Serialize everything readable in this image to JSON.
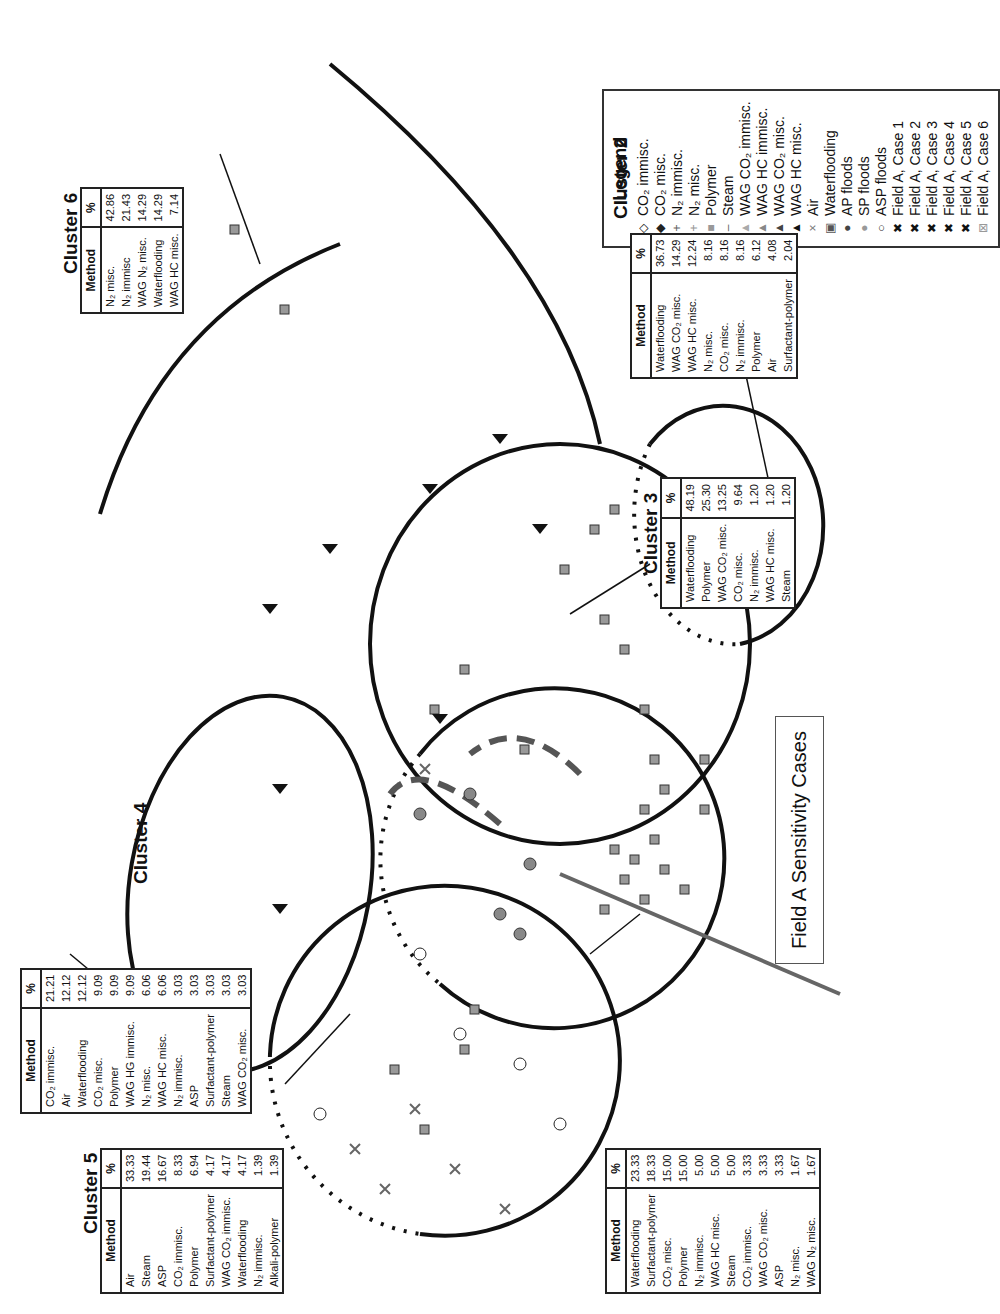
{
  "figure": {
    "orientation": "rotated 90deg counter-clockwise on page",
    "callout_label": "Field A Sensitivity Cases"
  },
  "legend": {
    "title": "Legend",
    "items": [
      {
        "symbol": "◇",
        "label": "CO₂ immisc.",
        "color": "#222"
      },
      {
        "symbol": "◆",
        "label": "CO₂ misc.",
        "color": "#222"
      },
      {
        "symbol": "+",
        "label": "N₂ immisc.",
        "color": "#666"
      },
      {
        "symbol": "+",
        "label": "N₂ misc.",
        "color": "#999"
      },
      {
        "symbol": "■",
        "label": "Polymer",
        "color": "#999"
      },
      {
        "symbol": "–",
        "label": "Steam",
        "color": "#666"
      },
      {
        "symbol": "▲",
        "label": "WAG CO₂ immisc.",
        "color": "#aaa"
      },
      {
        "symbol": "▲",
        "label": "WAG HC immisc.",
        "color": "#888"
      },
      {
        "symbol": "▲",
        "label": "WAG CO₂ misc.",
        "color": "#444"
      },
      {
        "symbol": "▲",
        "label": "WAG HC misc.",
        "color": "#111"
      },
      {
        "symbol": "×",
        "label": "Air",
        "color": "#777"
      },
      {
        "symbol": "▣",
        "label": "Waterflooding",
        "color": "#555"
      },
      {
        "symbol": "●",
        "label": "AP floods",
        "color": "#444"
      },
      {
        "symbol": "●",
        "label": "SP floods",
        "color": "#999"
      },
      {
        "symbol": "○",
        "label": "ASP floods",
        "color": "#222"
      },
      {
        "symbol": "✖",
        "label": "Field A, Case 1",
        "color": "#111"
      },
      {
        "symbol": "✖",
        "label": "Field A, Case 2",
        "color": "#111"
      },
      {
        "symbol": "✖",
        "label": "Field A, Case 3",
        "color": "#111"
      },
      {
        "symbol": "✖",
        "label": "Field A, Case 4",
        "color": "#111"
      },
      {
        "symbol": "✖",
        "label": "Field A, Case 5",
        "color": "#111"
      },
      {
        "symbol": "⊠",
        "label": "Field A, Case 6",
        "color": "#999"
      }
    ]
  },
  "clusters": [
    {
      "title": "Cluster 1",
      "headers": [
        "Method",
        "%"
      ],
      "rows": [
        [
          "Waterflooding",
          "23.33"
        ],
        [
          "Surfactant-polymer",
          "18.33"
        ],
        [
          "CO₂ misc.",
          "15.00"
        ],
        [
          "Polymer",
          "15.00"
        ],
        [
          "N₂ immisc.",
          "5.00"
        ],
        [
          "WAG HC misc.",
          "5.00"
        ],
        [
          "Steam",
          "5.00"
        ],
        [
          "CO₂ immisc.",
          "3.33"
        ],
        [
          "WAG CO₂ misc.",
          "3.33"
        ],
        [
          "ASP",
          "3.33"
        ],
        [
          "N₂ misc.",
          "1.67"
        ],
        [
          "WAG N₂ misc.",
          "1.67"
        ]
      ]
    },
    {
      "title": "Cluster 2",
      "headers": [
        "Method",
        "%"
      ],
      "rows": [
        [
          "Waterflooding",
          "36.73"
        ],
        [
          "WAG CO₂ misc.",
          "14.29"
        ],
        [
          "WAG HC misc.",
          "12.24"
        ],
        [
          "N₂ misc.",
          "8.16"
        ],
        [
          "CO₂ misc.",
          "8.16"
        ],
        [
          "N₂ immisc.",
          "8.16"
        ],
        [
          "Polymer",
          "6.12"
        ],
        [
          "Air",
          "4.08"
        ],
        [
          "Surfactant-polymer",
          "2.04"
        ]
      ]
    },
    {
      "title": "Cluster 3",
      "headers": [
        "Method",
        "%"
      ],
      "rows": [
        [
          "Waterflooding",
          "48.19"
        ],
        [
          "Polymer",
          "25.30"
        ],
        [
          "WAG CO₂ misc.",
          "13.25"
        ],
        [
          "CO₂ misc.",
          "9.64"
        ],
        [
          "N₂ immisc.",
          "1.20"
        ],
        [
          "WAG HC misc.",
          "1.20"
        ],
        [
          "Steam",
          "1.20"
        ]
      ]
    },
    {
      "title": "Cluster 4",
      "headers": [
        "Method",
        "%"
      ],
      "rows": [
        [
          "CO₂ immisc.",
          "21.21"
        ],
        [
          "Air",
          "12.12"
        ],
        [
          "Waterflooding",
          "12.12"
        ],
        [
          "CO₂ misc.",
          "9.09"
        ],
        [
          "Polymer",
          "9.09"
        ],
        [
          "WAG HG immisc.",
          "9.09"
        ],
        [
          "N₂ misc.",
          "6.06"
        ],
        [
          "WAG HC misc.",
          "6.06"
        ],
        [
          "N₂ immisc.",
          "3.03"
        ],
        [
          "ASP",
          "3.03"
        ],
        [
          "Surfactant-polymer",
          "3.03"
        ],
        [
          "Steam",
          "3.03"
        ],
        [
          "WAG CO₂ misc.",
          "3.03"
        ]
      ]
    },
    {
      "title": "Cluster 5",
      "headers": [
        "Method",
        "%"
      ],
      "rows": [
        [
          "Air",
          "33.33"
        ],
        [
          "Steam",
          "19.44"
        ],
        [
          "ASP",
          "16.67"
        ],
        [
          "CO₂ immisc.",
          "8.33"
        ],
        [
          "Polymer",
          "6.94"
        ],
        [
          "Surfactant-polymer",
          "4.17"
        ],
        [
          "WAG CO₂ immisc.",
          "4.17"
        ],
        [
          "Waterflooding",
          "4.17"
        ],
        [
          "N₂ immisc.",
          "1.39"
        ],
        [
          "Alkali-polymer",
          "1.39"
        ]
      ]
    },
    {
      "title": "Cluster 6",
      "headers": [
        "Method",
        "%"
      ],
      "rows": [
        [
          "N₂ misc.",
          "42.86"
        ],
        [
          "N₂ immisc",
          "21.43"
        ],
        [
          "WAG N₂ misc.",
          "14.29"
        ],
        [
          "Waterflooding",
          "14.29"
        ],
        [
          "WAG HC misc.",
          "7.14"
        ]
      ]
    }
  ]
}
